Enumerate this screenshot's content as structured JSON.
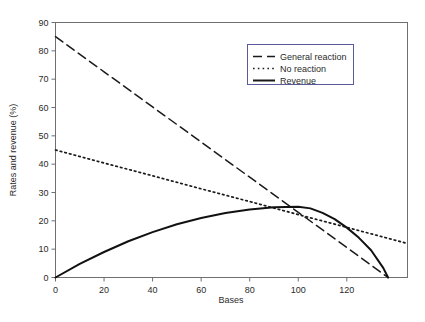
{
  "chart_data": {
    "type": "line",
    "title": "",
    "xlabel": "Bases",
    "ylabel": "Rates and revenue (%)",
    "xlim": [
      0,
      145
    ],
    "ylim": [
      0,
      90
    ],
    "xticks": [
      0,
      20,
      40,
      60,
      80,
      100,
      120
    ],
    "yticks": [
      0,
      10,
      20,
      30,
      40,
      50,
      60,
      70,
      80,
      90
    ],
    "xtick_labels": [
      "0",
      "20",
      "40",
      "60",
      "80",
      "100",
      "120"
    ],
    "ytick_labels": [
      "0",
      "10",
      "20",
      "30",
      "40",
      "50",
      "60",
      "70",
      "80",
      "90"
    ],
    "grid": false,
    "legend_position": "upper right",
    "frame": true,
    "series": [
      {
        "name": "General reaction",
        "style": "dashed",
        "color": "#1a1a1a",
        "x": [
          0,
          20,
          40,
          60,
          80,
          100,
          120,
          137
        ],
        "values": [
          85,
          72.6,
          60.2,
          47.8,
          35.4,
          23.0,
          10.6,
          0
        ]
      },
      {
        "name": "No reaction",
        "style": "dotted",
        "color": "#1a1a1a",
        "x": [
          0,
          20,
          40,
          60,
          80,
          100,
          120,
          145
        ],
        "values": [
          45,
          40.4,
          35.9,
          31.3,
          26.8,
          22.2,
          17.7,
          12.0
        ]
      },
      {
        "name": "Revenue",
        "style": "solid",
        "color": "#111111",
        "x": [
          0,
          10,
          20,
          30,
          40,
          50,
          60,
          70,
          80,
          90,
          100,
          105,
          110,
          115,
          120,
          125,
          130,
          135,
          137
        ],
        "values": [
          0,
          4.8,
          9.0,
          12.8,
          16.0,
          18.8,
          21.0,
          22.8,
          24.0,
          24.8,
          25.0,
          24.4,
          22.8,
          20.6,
          17.6,
          14.0,
          9.6,
          3.4,
          0
        ]
      }
    ],
    "intersection_note": "All three curves converge near (100, 25)"
  },
  "legend": {
    "entries": [
      {
        "label": "General reaction",
        "style": "dashed"
      },
      {
        "label": "No reaction",
        "style": "dotted"
      },
      {
        "label": "Revenue",
        "style": "solid"
      }
    ]
  }
}
